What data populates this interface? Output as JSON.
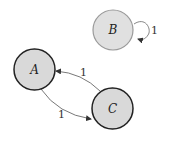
{
  "diagram": {
    "type": "state-diagram",
    "nodes": [
      {
        "id": "A",
        "label": "A",
        "cx": 34.5,
        "cy": 69.5,
        "r": 20.5,
        "fill": "#d9d9d9",
        "stroke": "#222222"
      },
      {
        "id": "B",
        "label": "B",
        "cx": 113,
        "cy": 30,
        "r": 20,
        "fill": "#e0e0e0",
        "stroke": "#9a9a9a"
      },
      {
        "id": "C",
        "label": "C",
        "cx": 112.5,
        "cy": 108.5,
        "r": 20.5,
        "fill": "#d9d9d9",
        "stroke": "#222222"
      }
    ],
    "edges": [
      {
        "from": "C",
        "to": "A",
        "label": "1"
      },
      {
        "from": "A",
        "to": "C",
        "label": "1"
      },
      {
        "from": "B",
        "to": "B",
        "label": "1"
      }
    ]
  }
}
